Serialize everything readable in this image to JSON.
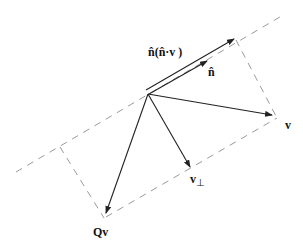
{
  "diagram": {
    "labels": {
      "projection": "n̂(n̂·v )",
      "normal": "n̂",
      "v": "v",
      "v_perp": "v",
      "v_perp_sub": "⊥",
      "reflected": "Qv"
    },
    "colors": {
      "vector": "#222222",
      "dashed": "#9a9a9a",
      "background": "#ffffff"
    },
    "origin": [
      148,
      94
    ],
    "vectors": [
      {
        "name": "projection",
        "to": [
          234,
          39
        ]
      },
      {
        "name": "normal",
        "to": [
          207,
          61
        ]
      },
      {
        "name": "v",
        "to": [
          272,
          115
        ]
      },
      {
        "name": "v_perp",
        "to": [
          190,
          167
        ]
      },
      {
        "name": "reflected",
        "to": [
          106,
          213
        ]
      }
    ]
  }
}
